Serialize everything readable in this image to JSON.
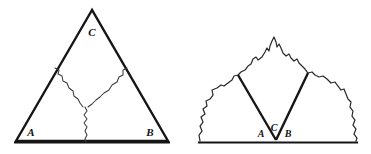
{
  "figure": {
    "background_color": "#ffffff",
    "stroke_color": "#161616",
    "crack_color": "#3a3a3a",
    "outline_color": "#2b2b2b",
    "panels": [
      {
        "id": "left-panel",
        "name": "triangle-with-crack",
        "labels": [
          {
            "id": "left-label-c",
            "text": "C",
            "x": 92,
            "y": 36
          },
          {
            "id": "left-label-a",
            "text": "A",
            "x": 31,
            "y": 136
          },
          {
            "id": "left-label-b",
            "text": "B",
            "x": 150,
            "y": 136
          }
        ],
        "triangle": {
          "apex": {
            "x": 92,
            "y": 10
          },
          "left_base": {
            "x": 16,
            "y": 141
          },
          "right_base": {
            "x": 168,
            "y": 141
          }
        },
        "triangle_path": "M 92 10 L 16 141 L 168 141 Z",
        "baseline_path": "M 15 142.5 L 169 142.5",
        "crack_left_branch": "M 55 68 L 59 70 L 58 74 L 62 76 L 63 81 L 67 83 L 69 88 L 73 91 L 74 96 L 78 99 L 80 103 L 83 107",
        "crack_right_branch": "M 127 68 L 123 70 L 123 75 L 119 77 L 117 82 L 112 85 L 109 90 L 104 93 L 100 97 L 96 100 L 92 104 L 88 107",
        "crack_stem": "M 85 107 L 87 111 L 84 115 L 87 119 L 84 123 L 87 127 L 85 131 L 87 135 L 85 139 L 86 142"
      },
      {
        "id": "right-panel",
        "name": "mountain-with-inscribed-v",
        "labels": [
          {
            "id": "right-label-a",
            "text": "A",
            "x": 261,
            "y": 137
          },
          {
            "id": "right-label-c",
            "text": "C",
            "x": 274,
            "y": 131
          },
          {
            "id": "right-label-b",
            "text": "B",
            "x": 288,
            "y": 137
          }
        ],
        "vertex": {
          "x": 276,
          "y": 140
        },
        "left_arm_top": {
          "x": 238,
          "y": 75
        },
        "right_arm_top": {
          "x": 308,
          "y": 73
        },
        "mountain_outline": "M 200 141 L 199 135 L 202 131 L 200 126 L 203 122 L 201 117 L 205 114 L 203 109 L 207 106 L 206 101 L 210 99 L 213 95 L 212 90 L 217 88 L 221 85 L 224 86 L 228 83 L 232 80 L 234 76 L 238 75 L 241 72 L 245 70 L 248 66 L 251 64 L 253 59 L 256 57 L 258 60 L 262 57 L 265 52 L 267 48 L 269 51 L 270 46 L 272 41 L 274 37 L 276 42 L 277 47 L 279 44 L 281 48 L 283 53 L 286 56 L 289 54 L 291 58 L 294 61 L 297 59 L 299 63 L 302 66 L 305 69 L 308 73 L 312 72 L 315 75 L 319 77 L 323 76 L 327 79 L 331 83 L 335 82 L 338 86 L 341 90 L 344 89 L 346 94 L 348 99 L 351 102 L 350 107 L 353 111 L 352 116 L 355 120 L 353 125 L 356 129 L 354 134 L 357 138 L 356 141",
        "baseline_path": "M 199 142.5 L 357 142.5",
        "left_arm_path": "M 238 75 L 276 140",
        "right_arm_path": "M 308 73 L 276 140"
      }
    ]
  }
}
